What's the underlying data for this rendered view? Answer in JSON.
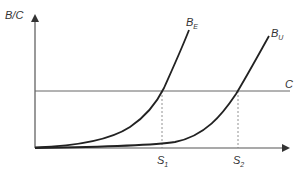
{
  "diagram": {
    "y_axis_label": "B/C",
    "cost_line_label": "C",
    "curves": [
      {
        "name": "B",
        "subscript": "E"
      },
      {
        "name": "B",
        "subscript": "U"
      }
    ],
    "x_ticks": [
      {
        "name": "S",
        "subscript": "1"
      },
      {
        "name": "S",
        "subscript": "2"
      }
    ],
    "colors": {
      "axis": "#555555",
      "curve": "#222222",
      "cost_line": "#555555",
      "dashed": "#666666",
      "text": "#333333"
    }
  }
}
